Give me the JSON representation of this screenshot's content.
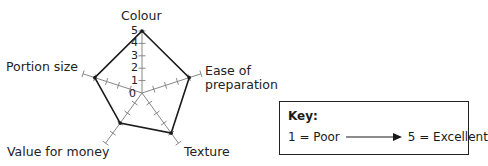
{
  "chart_data": {
    "type": "radar",
    "title": "",
    "axes": [
      "Colour",
      "Ease of preparation",
      "Texture",
      "Value for money",
      "Portion size"
    ],
    "axis_labels_display": {
      "colour": "Colour",
      "ease_line1": "Ease of",
      "ease_line2": "preparation",
      "texture": "Texture",
      "value": "Value for money",
      "portion": "Portion size"
    },
    "series": [
      {
        "name": "Rating",
        "values": [
          5,
          4,
          4,
          3,
          4
        ]
      }
    ],
    "scale": {
      "min": 0,
      "max": 5,
      "ticks": [
        0,
        1,
        2,
        3,
        4,
        5
      ]
    },
    "tick_labels": [
      "0",
      "1",
      "2",
      "3",
      "4",
      "5"
    ],
    "grid": false,
    "line_color": "#1a1a1a",
    "axis_color": "#888888"
  },
  "key": {
    "title": "Key:",
    "low_label": "1 = Poor",
    "high_label": "5 = Excellent"
  }
}
